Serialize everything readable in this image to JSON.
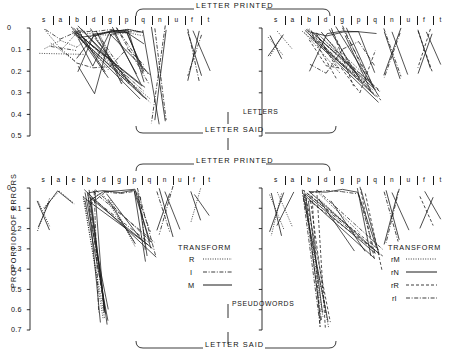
{
  "figure": {
    "y_axis_label": "PROPORTION OF ERRORS",
    "top_header": "LETTER PRINTED",
    "middle_header_said": "LETTER SAID",
    "middle_header_printed": "LETTER PRINTED",
    "bottom_header": "LETTER SAID",
    "row_label_top": "LETTERS",
    "row_label_bottom": "PSEUDOWORDS",
    "line_color": "#1a1a1a"
  },
  "legend_left": {
    "title": "TRANSFORM",
    "entries": [
      {
        "label": "R",
        "style": "dotted"
      },
      {
        "label": "I",
        "style": "dash-dot"
      },
      {
        "label": "M",
        "style": "solid"
      }
    ]
  },
  "legend_right": {
    "title": "TRANSFORM",
    "entries": [
      {
        "label": "rM",
        "style": "dotted"
      },
      {
        "label": "rN",
        "style": "solid"
      },
      {
        "label": "rR",
        "style": "dashed"
      },
      {
        "label": "rI",
        "style": "dash-dot"
      }
    ]
  },
  "chart_data": {
    "type": "line",
    "xlabel": "",
    "ylabel": "PROPORTION OF ERRORS",
    "grid": false,
    "legend_position": "inside-lower-right",
    "panels": [
      {
        "id": "top-left",
        "column": "LETTERS",
        "top_axis": "LETTER PRINTED",
        "bottom_axis": "LETTER SAID",
        "categories": [
          "s",
          "a",
          "b",
          "d",
          "g",
          "p",
          "q",
          "n",
          "u",
          "f",
          "t"
        ],
        "ylim": [
          0,
          0.5
        ],
        "yticks": [
          0,
          0.1,
          0.2,
          0.3,
          0.4,
          0.5
        ],
        "ytick_labels": [
          "0",
          "0.1",
          "0.2",
          "0.3",
          "0.4",
          "0.5"
        ],
        "series": [
          {
            "name": "R-1",
            "style": "dotted",
            "values": [
              0.005,
              0.1,
              0.02,
              0.03,
              0.02,
              0.01,
              0.02,
              null,
              null,
              null,
              null
            ]
          },
          {
            "name": "R-2",
            "style": "dotted",
            "values": [
              0.1,
              0.055,
              0.09,
              0.035,
              0.03,
              0.02,
              0.04,
              null,
              null,
              null,
              null
            ]
          },
          {
            "name": "I-1",
            "style": "dash-dot",
            "values": [
              0.005,
              0.055,
              0.015,
              0.02,
              0.01,
              0.015,
              0.02,
              null,
              null,
              null,
              null
            ]
          },
          {
            "name": "I-2",
            "style": "dash-dot",
            "values": [
              null,
              0.095,
              0.165,
              0.18,
              0.175,
              0.095,
              0.17,
              null,
              null,
              null,
              null
            ]
          },
          {
            "name": "M-1",
            "style": "solid",
            "values": [
              null,
              null,
              0.14,
              0.04,
              0.02,
              0.01,
              0.02,
              null,
              null,
              null,
              null
            ]
          },
          {
            "name": "M-2",
            "style": "solid",
            "values": [
              null,
              null,
              0.05,
              0.175,
              0.01,
              0.02,
              0.21,
              null,
              null,
              null,
              null
            ]
          },
          {
            "name": "M-3",
            "style": "solid",
            "values": [
              null,
              null,
              0.175,
              0.3,
              0.025,
              0.015,
              0.205,
              null,
              null,
              null,
              null
            ]
          },
          {
            "name": "M-4",
            "style": "solid",
            "values": [
              null,
              null,
              0.045,
              0.03,
              0.015,
              0.015,
              0.255,
              null,
              null,
              null,
              null
            ]
          },
          {
            "name": "M-5",
            "style": "solid",
            "values": [
              null,
              null,
              0.205,
              0.025,
              0.02,
              0.02,
              0.075,
              null,
              null,
              null,
              null
            ]
          },
          {
            "name": "cluster-q-n",
            "style": "mixed",
            "values": [
              null,
              null,
              null,
              null,
              null,
              null,
              0.01,
              0.45,
              null,
              null,
              null
            ]
          },
          {
            "name": "cluster-f-t",
            "style": "mixed",
            "values": [
              null,
              null,
              null,
              null,
              null,
              null,
              null,
              null,
              null,
              0.015,
              0.2
            ]
          }
        ]
      },
      {
        "id": "top-right",
        "column": "LETTERS",
        "top_axis": "LETTER PRINTED",
        "bottom_axis": "LETTER SAID",
        "categories": [
          "s",
          "a",
          "b",
          "d",
          "g",
          "p",
          "q",
          "n",
          "u",
          "f",
          "t"
        ],
        "ylim": [
          0,
          0.5
        ],
        "yticks": [
          0,
          0.1,
          0.2,
          0.3,
          0.4,
          0.5
        ],
        "ytick_labels": [
          "",
          "",
          "",
          "",
          "",
          ""
        ],
        "series": [
          {
            "name": "rM-1",
            "style": "dotted",
            "values": [
              0.01,
              0.1,
              null,
              null,
              null,
              null,
              null,
              null,
              null,
              null,
              null
            ]
          },
          {
            "name": "rN-1",
            "style": "solid",
            "values": [
              null,
              null,
              0.02,
              0.04,
              0.02,
              0.015,
              0.03,
              null,
              null,
              null,
              null
            ]
          },
          {
            "name": "rN-2",
            "style": "solid",
            "values": [
              null,
              null,
              0.2,
              0.03,
              0.015,
              0.02,
              0.21,
              null,
              null,
              null,
              null
            ]
          },
          {
            "name": "rR-1",
            "style": "dashed",
            "values": [
              null,
              null,
              0.05,
              0.175,
              0.185,
              0.3,
              0.1,
              null,
              null,
              null,
              null
            ]
          },
          {
            "name": "rI-1",
            "style": "dash-dot",
            "values": [
              null,
              null,
              0.17,
              0.21,
              0.1,
              0.06,
              0.175,
              null,
              null,
              null,
              null
            ]
          },
          {
            "name": "cluster-n-u",
            "style": "mixed",
            "values": [
              null,
              null,
              null,
              null,
              null,
              null,
              null,
              0.02,
              0.22,
              null,
              null
            ]
          },
          {
            "name": "cluster-f-t",
            "style": "mixed",
            "values": [
              null,
              null,
              null,
              null,
              null,
              null,
              null,
              null,
              null,
              0.02,
              0.17
            ]
          }
        ]
      },
      {
        "id": "bottom-left",
        "column": "PSEUDOWORDS",
        "top_axis": "LETTER PRINTED",
        "bottom_axis": "LETTER SAID",
        "categories": [
          "s",
          "a",
          "e",
          "b",
          "d",
          "g",
          "p",
          "q",
          "n",
          "u",
          "f",
          "t"
        ],
        "ylim": [
          0,
          0.7
        ],
        "yticks": [
          0,
          0.1,
          0.2,
          0.3,
          0.4,
          0.5,
          0.6,
          0.7
        ],
        "ytick_labels": [
          "0",
          "0.1",
          "0.2",
          "0.3",
          "0.4",
          "0.5",
          "0.6",
          "0.7"
        ],
        "series": [
          {
            "name": "R-1",
            "style": "dotted",
            "values": [
              0.1,
              0.02,
              0.08,
              null,
              null,
              null,
              null,
              null,
              null,
              null,
              null,
              null
            ]
          },
          {
            "name": "M-1",
            "style": "solid",
            "values": [
              0.105,
              0.015,
              0.075,
              null,
              null,
              null,
              null,
              null,
              null,
              null,
              null,
              null
            ]
          },
          {
            "name": "M-2",
            "style": "solid",
            "values": [
              null,
              null,
              null,
              0.02,
              0.01,
              0.02,
              0.015,
              0.265,
              null,
              null,
              null,
              null
            ]
          },
          {
            "name": "M-3",
            "style": "solid",
            "values": [
              null,
              null,
              null,
              0.06,
              0.015,
              0.015,
              0.01,
              0.3,
              null,
              null,
              null,
              null
            ]
          },
          {
            "name": "I-1",
            "style": "dash-dot",
            "values": [
              null,
              null,
              null,
              0.085,
              0.02,
              0.03,
              0.02,
              0.215,
              null,
              null,
              null,
              null
            ]
          },
          {
            "name": "M-4",
            "style": "solid",
            "values": [
              null,
              null,
              null,
              0.07,
              0.62,
              null,
              null,
              null,
              null,
              null,
              null,
              null
            ]
          },
          {
            "name": "cluster-n-u",
            "style": "mixed",
            "values": [
              null,
              null,
              null,
              null,
              null,
              null,
              null,
              null,
              0.02,
              0.2,
              null,
              null
            ]
          },
          {
            "name": "cluster-f-t",
            "style": "mixed",
            "values": [
              null,
              null,
              null,
              null,
              null,
              null,
              null,
              null,
              null,
              null,
              0.03,
              0.14
            ]
          }
        ]
      },
      {
        "id": "bottom-right",
        "column": "PSEUDOWORDS",
        "top_axis": "LETTER PRINTED",
        "bottom_axis": "LETTER SAID",
        "categories": [
          "s",
          "a",
          "b",
          "d",
          "g",
          "p",
          "q",
          "n",
          "u",
          "f",
          "t"
        ],
        "ylim": [
          0,
          0.7
        ],
        "yticks": [
          0,
          0.1,
          0.2,
          0.3,
          0.4,
          0.5,
          0.6,
          0.7
        ],
        "ytick_labels": [
          "",
          "",
          "",
          "",
          "",
          "",
          "",
          ""
        ],
        "series": [
          {
            "name": "rM-1",
            "style": "dotted",
            "values": [
              0.02,
              0.19,
              null,
              null,
              null,
              null,
              null,
              null,
              null,
              null,
              null
            ]
          },
          {
            "name": "rN-1",
            "style": "solid",
            "values": [
              0.19,
              0.02,
              null,
              null,
              null,
              null,
              null,
              null,
              null,
              null,
              null
            ]
          },
          {
            "name": "rN-2",
            "style": "solid",
            "values": [
              null,
              null,
              0.015,
              0.025,
              0.01,
              0.02,
              0.3,
              null,
              null,
              null,
              null
            ]
          },
          {
            "name": "rR-1",
            "style": "dashed",
            "values": [
              null,
              null,
              0.04,
              0.62,
              null,
              null,
              null,
              null,
              null,
              null,
              null
            ]
          },
          {
            "name": "rI-1",
            "style": "dash-dot",
            "values": [
              null,
              null,
              0.02,
              0.015,
              0.02,
              0.03,
              0.33,
              null,
              null,
              null,
              null
            ]
          },
          {
            "name": "cluster-n-u",
            "style": "mixed",
            "values": [
              null,
              null,
              null,
              null,
              null,
              null,
              null,
              0.02,
              0.21,
              null,
              null
            ]
          },
          {
            "name": "cluster-f-t",
            "style": "mixed",
            "values": [
              null,
              null,
              null,
              null,
              null,
              null,
              null,
              null,
              null,
              0.02,
              0.15
            ]
          }
        ]
      }
    ]
  }
}
